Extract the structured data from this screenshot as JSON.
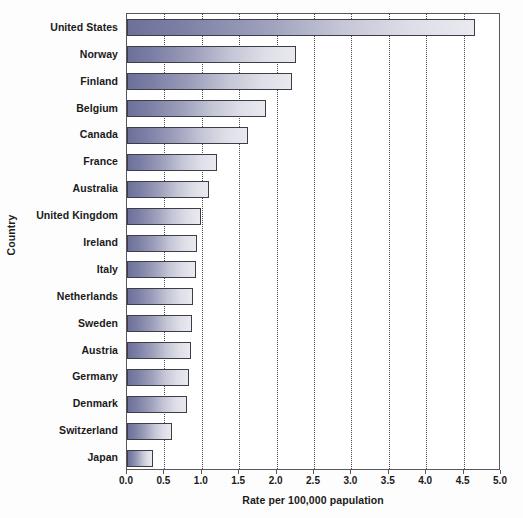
{
  "chart_data": {
    "type": "bar",
    "orientation": "horizontal",
    "title": "",
    "xlabel": "Rate per 100,000 papulation",
    "ylabel": "Country",
    "xlim": [
      0.0,
      5.0
    ],
    "xticks": [
      "0.0",
      "0.5",
      "1.0",
      "1.5",
      "2.0",
      "2.5",
      "3.0",
      "3.5",
      "4.0",
      "4.5",
      "5.0"
    ],
    "xtick_values": [
      0.0,
      0.5,
      1.0,
      1.5,
      2.0,
      2.5,
      3.0,
      3.5,
      4.0,
      4.5,
      5.0
    ],
    "grid": "vertical-dotted",
    "legend": "none",
    "categories": [
      "United States",
      "Norway",
      "Finland",
      "Belgium",
      "Canada",
      "France",
      "Australia",
      "United Kingdom",
      "Ireland",
      "Italy",
      "Netherlands",
      "Sweden",
      "Austria",
      "Germany",
      "Denmark",
      "Switzerland",
      "Japan"
    ],
    "values": [
      4.65,
      2.26,
      2.21,
      1.86,
      1.62,
      1.2,
      1.1,
      0.99,
      0.94,
      0.92,
      0.88,
      0.87,
      0.86,
      0.83,
      0.8,
      0.6,
      0.35
    ],
    "bar_gradient_start": "#6d7099",
    "bar_gradient_end": "#e9e9ef",
    "bar_border_color": "#3d3d47",
    "gridline_color": "#4a4a4a",
    "axis_color": "#58585c",
    "text_color": "#1a1a1a",
    "background": "#ffffff"
  }
}
